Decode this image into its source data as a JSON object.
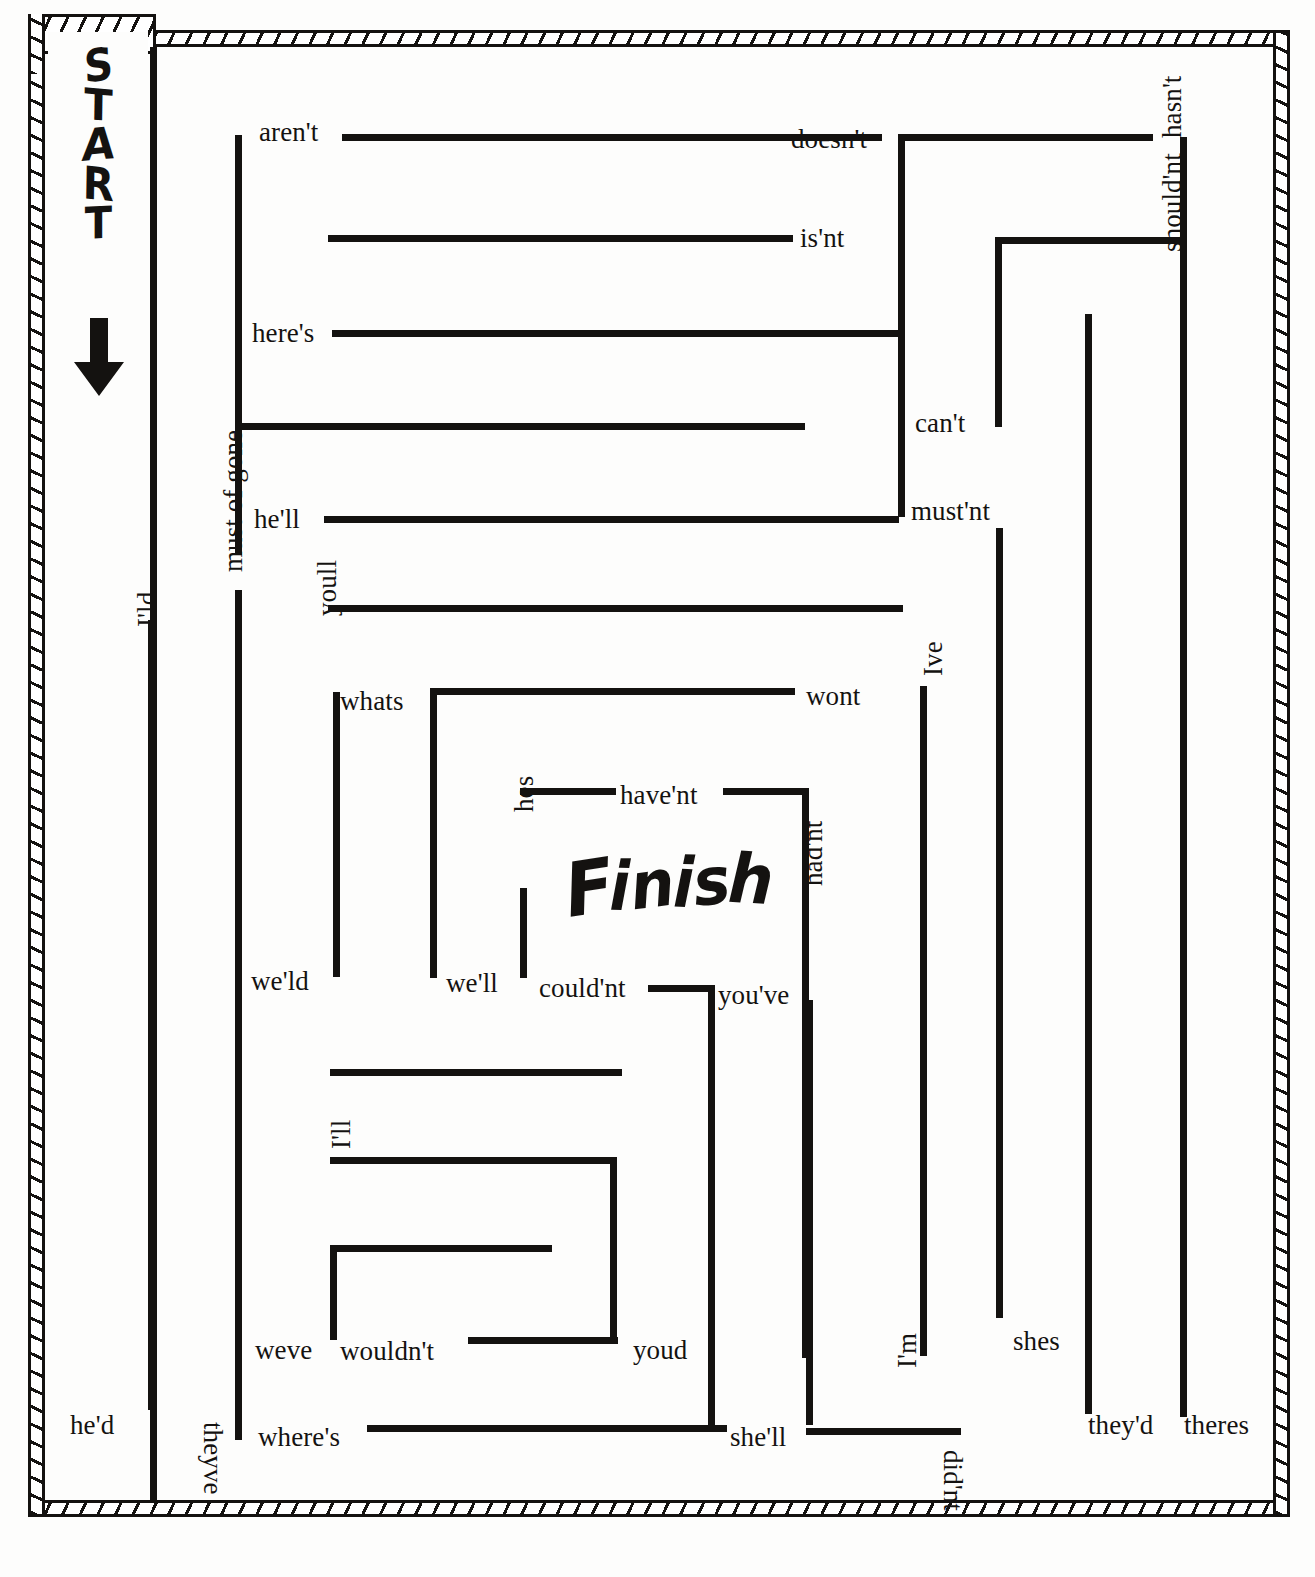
{
  "page": {
    "kind": "contraction-maze-worksheet",
    "ink_color": "#141210",
    "paper_color": "#fdfdfc"
  },
  "markers": {
    "start_label": "START",
    "start_letters": [
      "S",
      "T",
      "A",
      "R",
      "T"
    ],
    "start_arrow_icon": "down-arrow-icon",
    "finish_label": "Finish",
    "finish_letters": [
      "F",
      "i",
      "n",
      "i",
      "s",
      "h"
    ]
  },
  "labels": [
    {
      "text": "aren't",
      "x": 259,
      "y": 119,
      "rot": 0
    },
    {
      "text": "doesn't",
      "x": 791,
      "y": 126,
      "rot": 0
    },
    {
      "text": "hasn't",
      "x": 1159,
      "y": 138,
      "rot": -90
    },
    {
      "text": "is'nt",
      "x": 800,
      "y": 225,
      "rot": 0
    },
    {
      "text": "should'nt",
      "x": 1159,
      "y": 252,
      "rot": -90
    },
    {
      "text": "here's",
      "x": 252,
      "y": 320,
      "rot": 0
    },
    {
      "text": "can't",
      "x": 915,
      "y": 410,
      "rot": 0
    },
    {
      "text": "he'll",
      "x": 254,
      "y": 506,
      "rot": 0
    },
    {
      "text": "must'nt",
      "x": 911,
      "y": 498,
      "rot": 0
    },
    {
      "text": "I'ld",
      "x": 134,
      "y": 627,
      "rot": -90
    },
    {
      "text": "must of gone",
      "x": 220,
      "y": 572,
      "rot": -90
    },
    {
      "text": "youll",
      "x": 314,
      "y": 616,
      "rot": -90
    },
    {
      "text": "whats",
      "x": 340,
      "y": 688,
      "rot": 0
    },
    {
      "text": "wont",
      "x": 806,
      "y": 683,
      "rot": 0
    },
    {
      "text": "Ive",
      "x": 920,
      "y": 676,
      "rot": -90
    },
    {
      "text": "have'nt",
      "x": 620,
      "y": 782,
      "rot": 0
    },
    {
      "text": "hes",
      "x": 511,
      "y": 812,
      "rot": -90
    },
    {
      "text": "had'nt",
      "x": 800,
      "y": 886,
      "rot": -90
    },
    {
      "text": "we'ld",
      "x": 251,
      "y": 968,
      "rot": 0
    },
    {
      "text": "we'll",
      "x": 446,
      "y": 970,
      "rot": 0
    },
    {
      "text": "could'nt",
      "x": 539,
      "y": 975,
      "rot": 0
    },
    {
      "text": "you've",
      "x": 718,
      "y": 982,
      "rot": 0
    },
    {
      "text": "I'll",
      "x": 328,
      "y": 1149,
      "rot": -90
    },
    {
      "text": "weve",
      "x": 255,
      "y": 1337,
      "rot": 0
    },
    {
      "text": "wouldn't",
      "x": 340,
      "y": 1338,
      "rot": 0
    },
    {
      "text": "youd",
      "x": 633,
      "y": 1337,
      "rot": 0
    },
    {
      "text": "shes",
      "x": 1013,
      "y": 1328,
      "rot": 0
    },
    {
      "text": "I'm",
      "x": 894,
      "y": 1368,
      "rot": -90
    },
    {
      "text": "they'd",
      "x": 1088,
      "y": 1412,
      "rot": 0
    },
    {
      "text": "theres",
      "x": 1184,
      "y": 1412,
      "rot": 0
    },
    {
      "text": "he'd",
      "x": 70,
      "y": 1412,
      "rot": 0
    },
    {
      "text": "where's",
      "x": 258,
      "y": 1424,
      "rot": 0
    },
    {
      "text": "she'll",
      "x": 730,
      "y": 1424,
      "rot": 0
    },
    {
      "text": "theyve",
      "x": 226,
      "y": 1422,
      "rot": 90
    },
    {
      "text": "did'nt",
      "x": 966,
      "y": 1450,
      "rot": 90
    }
  ],
  "walls": [
    {
      "o": "v",
      "x": 150,
      "y": 47,
      "len": 1453
    },
    {
      "o": "v",
      "x": 148,
      "y": 620,
      "len": 790
    },
    {
      "o": "v",
      "x": 235,
      "y": 135,
      "len": 420
    },
    {
      "o": "v",
      "x": 235,
      "y": 590,
      "len": 850
    },
    {
      "o": "h",
      "x": 342,
      "y": 134,
      "len": 540
    },
    {
      "o": "h",
      "x": 328,
      "y": 235,
      "len": 465
    },
    {
      "o": "h",
      "x": 332,
      "y": 330,
      "len": 570
    },
    {
      "o": "h",
      "x": 235,
      "y": 423,
      "len": 570
    },
    {
      "o": "h",
      "x": 324,
      "y": 516,
      "len": 575
    },
    {
      "o": "v",
      "x": 898,
      "y": 137,
      "len": 380
    },
    {
      "o": "h",
      "x": 898,
      "y": 134,
      "len": 255
    },
    {
      "o": "v",
      "x": 1180,
      "y": 137,
      "len": 105
    },
    {
      "o": "h",
      "x": 995,
      "y": 237,
      "len": 192
    },
    {
      "o": "v",
      "x": 995,
      "y": 237,
      "len": 190
    },
    {
      "o": "v",
      "x": 1180,
      "y": 237,
      "len": 1180
    },
    {
      "o": "v",
      "x": 1085,
      "y": 314,
      "len": 1100
    },
    {
      "o": "h",
      "x": 328,
      "y": 605,
      "len": 575
    },
    {
      "o": "v",
      "x": 333,
      "y": 692,
      "len": 285
    },
    {
      "o": "h",
      "x": 430,
      "y": 688,
      "len": 365
    },
    {
      "o": "v",
      "x": 430,
      "y": 688,
      "len": 290
    },
    {
      "o": "v",
      "x": 920,
      "y": 686,
      "len": 670
    },
    {
      "o": "h",
      "x": 520,
      "y": 788,
      "len": 96
    },
    {
      "o": "h",
      "x": 723,
      "y": 788,
      "len": 86
    },
    {
      "o": "v",
      "x": 802,
      "y": 788,
      "len": 570
    },
    {
      "o": "v",
      "x": 520,
      "y": 888,
      "len": 90
    },
    {
      "o": "h",
      "x": 648,
      "y": 985,
      "len": 66
    },
    {
      "o": "v",
      "x": 708,
      "y": 985,
      "len": 445
    },
    {
      "o": "h",
      "x": 330,
      "y": 1069,
      "len": 292
    },
    {
      "o": "h",
      "x": 330,
      "y": 1157,
      "len": 287
    },
    {
      "o": "v",
      "x": 610,
      "y": 1157,
      "len": 185
    },
    {
      "o": "h",
      "x": 330,
      "y": 1245,
      "len": 222
    },
    {
      "o": "v",
      "x": 330,
      "y": 1245,
      "len": 95
    },
    {
      "o": "h",
      "x": 468,
      "y": 1337,
      "len": 150
    },
    {
      "o": "h",
      "x": 367,
      "y": 1425,
      "len": 360
    },
    {
      "o": "v",
      "x": 806,
      "y": 1000,
      "len": 425
    },
    {
      "o": "h",
      "x": 806,
      "y": 1428,
      "len": 155
    },
    {
      "o": "v",
      "x": 996,
      "y": 528,
      "len": 790
    }
  ]
}
